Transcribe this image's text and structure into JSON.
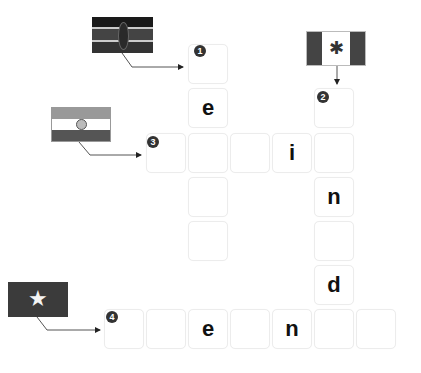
{
  "puzzle": {
    "type": "flag-crossword",
    "clues": [
      {
        "number": "1",
        "flag": "kenya-flag",
        "direction": "down"
      },
      {
        "number": "2",
        "flag": "canada-flag",
        "direction": "down"
      },
      {
        "number": "3",
        "flag": "india-flag",
        "direction": "across"
      },
      {
        "number": "4",
        "flag": "vietnam-flag",
        "direction": "across"
      }
    ],
    "cells": [
      {
        "id": "c1",
        "x": 188,
        "y": 44,
        "letter": "",
        "num": "1"
      },
      {
        "id": "c2",
        "x": 188,
        "y": 88,
        "letter": "e",
        "num": ""
      },
      {
        "id": "c3",
        "x": 188,
        "y": 133,
        "letter": "",
        "num": ""
      },
      {
        "id": "c4",
        "x": 188,
        "y": 177,
        "letter": "",
        "num": ""
      },
      {
        "id": "c5",
        "x": 188,
        "y": 221,
        "letter": "",
        "num": ""
      },
      {
        "id": "c6",
        "x": 146,
        "y": 133,
        "letter": "",
        "num": "3"
      },
      {
        "id": "c7",
        "x": 230,
        "y": 133,
        "letter": "",
        "num": ""
      },
      {
        "id": "c8",
        "x": 272,
        "y": 133,
        "letter": "i",
        "num": ""
      },
      {
        "id": "c9",
        "x": 314,
        "y": 88,
        "letter": "",
        "num": "2"
      },
      {
        "id": "c10",
        "x": 314,
        "y": 133,
        "letter": "",
        "num": ""
      },
      {
        "id": "c11",
        "x": 314,
        "y": 177,
        "letter": "n",
        "num": ""
      },
      {
        "id": "c12",
        "x": 314,
        "y": 221,
        "letter": "",
        "num": ""
      },
      {
        "id": "c13",
        "x": 314,
        "y": 265,
        "letter": "d",
        "num": ""
      },
      {
        "id": "c14",
        "x": 104,
        "y": 309,
        "letter": "",
        "num": "4"
      },
      {
        "id": "c15",
        "x": 146,
        "y": 309,
        "letter": "",
        "num": ""
      },
      {
        "id": "c16",
        "x": 188,
        "y": 309,
        "letter": "e",
        "num": ""
      },
      {
        "id": "c17",
        "x": 230,
        "y": 309,
        "letter": "",
        "num": ""
      },
      {
        "id": "c18",
        "x": 272,
        "y": 309,
        "letter": "n",
        "num": ""
      },
      {
        "id": "c19",
        "x": 314,
        "y": 309,
        "letter": "",
        "num": ""
      },
      {
        "id": "c20",
        "x": 356,
        "y": 309,
        "letter": "",
        "num": ""
      }
    ]
  },
  "colors": {
    "cell_border": "#ececec",
    "badge": "#333333",
    "letter": "#111111"
  }
}
